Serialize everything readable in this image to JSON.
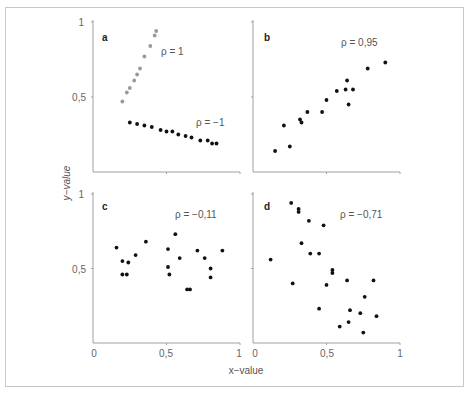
{
  "chart_data": [
    {
      "type": "scatter",
      "panel": "a",
      "xlim": [
        0,
        1
      ],
      "ylim": [
        0,
        1
      ],
      "series": [
        {
          "name": "ρ = 1",
          "color": "#999999",
          "x": [
            0.2,
            0.23,
            0.25,
            0.28,
            0.3,
            0.32,
            0.35,
            0.39,
            0.42,
            0.43
          ],
          "y": [
            0.47,
            0.53,
            0.56,
            0.61,
            0.65,
            0.69,
            0.77,
            0.84,
            0.91,
            0.94
          ]
        },
        {
          "name": "ρ = −1",
          "color": "#111111",
          "x": [
            0.25,
            0.3,
            0.35,
            0.4,
            0.46,
            0.5,
            0.54,
            0.58,
            0.63,
            0.67,
            0.73,
            0.78,
            0.81,
            0.84
          ],
          "y": [
            0.33,
            0.32,
            0.31,
            0.3,
            0.28,
            0.27,
            0.27,
            0.25,
            0.24,
            0.23,
            0.21,
            0.21,
            0.19,
            0.19
          ]
        }
      ],
      "annotations": [
        "ρ = 1",
        "ρ = −1"
      ]
    },
    {
      "type": "scatter",
      "panel": "b",
      "xlim": [
        0,
        1
      ],
      "ylim": [
        0,
        1
      ],
      "series": [
        {
          "name": "ρ = 0,95",
          "color": "#111111",
          "x": [
            0.15,
            0.21,
            0.25,
            0.32,
            0.33,
            0.37,
            0.47,
            0.5,
            0.57,
            0.63,
            0.64,
            0.65,
            0.68,
            0.78,
            0.9
          ],
          "y": [
            0.14,
            0.31,
            0.17,
            0.35,
            0.33,
            0.4,
            0.4,
            0.48,
            0.54,
            0.55,
            0.61,
            0.45,
            0.55,
            0.69,
            0.73
          ]
        }
      ],
      "annotations": [
        "ρ = 0,95"
      ]
    },
    {
      "type": "scatter",
      "panel": "c",
      "xlim": [
        0,
        1
      ],
      "ylim": [
        0,
        1
      ],
      "series": [
        {
          "name": "ρ = −0,11",
          "color": "#111111",
          "x": [
            0.16,
            0.2,
            0.2,
            0.23,
            0.24,
            0.29,
            0.36,
            0.51,
            0.51,
            0.52,
            0.56,
            0.59,
            0.64,
            0.66,
            0.71,
            0.76,
            0.8,
            0.8,
            0.88
          ],
          "y": [
            0.64,
            0.55,
            0.46,
            0.46,
            0.54,
            0.59,
            0.68,
            0.63,
            0.51,
            0.46,
            0.73,
            0.57,
            0.36,
            0.36,
            0.62,
            0.57,
            0.5,
            0.44,
            0.62
          ]
        }
      ],
      "annotations": [
        "ρ = −0,11"
      ]
    },
    {
      "type": "scatter",
      "panel": "d",
      "xlim": [
        0,
        1
      ],
      "ylim": [
        0,
        1
      ],
      "series": [
        {
          "name": "ρ = −0,71",
          "color": "#111111",
          "x": [
            0.26,
            0.31,
            0.31,
            0.38,
            0.48,
            0.33,
            0.39,
            0.45,
            0.12,
            0.54,
            0.54,
            0.27,
            0.5,
            0.64,
            0.82,
            0.76,
            0.45,
            0.66,
            0.73,
            0.84,
            0.59,
            0.65,
            0.75
          ],
          "y": [
            0.94,
            0.9,
            0.88,
            0.82,
            0.79,
            0.67,
            0.6,
            0.6,
            0.56,
            0.49,
            0.47,
            0.4,
            0.39,
            0.42,
            0.42,
            0.31,
            0.23,
            0.22,
            0.2,
            0.18,
            0.11,
            0.14,
            0.07
          ]
        }
      ],
      "annotations": [
        "ρ = −0,71"
      ]
    }
  ],
  "labels": {
    "xlabel": "x−value",
    "ylabel": "y−value",
    "x_ticks": [
      "0",
      "0,5",
      "1"
    ],
    "y_ticks": [
      "0,5",
      "1"
    ],
    "panels": {
      "a": {
        "letter": "a",
        "rho_pos": "ρ = 1",
        "rho_neg": "ρ = −1"
      },
      "b": {
        "letter": "b",
        "rho": "ρ = 0,95"
      },
      "c": {
        "letter": "c",
        "rho": "ρ = −0,11"
      },
      "d": {
        "letter": "d",
        "rho": "ρ = −0,71"
      }
    }
  },
  "colors": {
    "axis": "#a0a0a0",
    "dot_black": "#111111",
    "dot_grey": "#999999",
    "frame": "#c8c8c8"
  }
}
